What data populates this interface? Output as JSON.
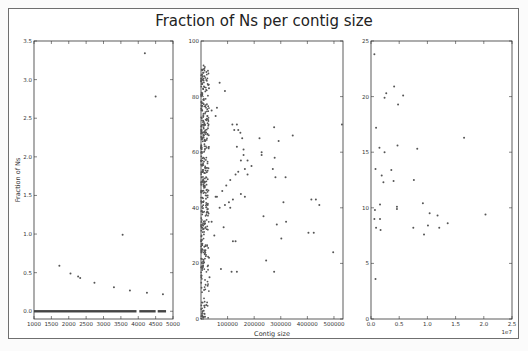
{
  "chart_data": {
    "title": "Fraction of Ns per contig size",
    "type": "scatter",
    "panels": [
      {
        "id": "left",
        "xlabel": "",
        "ylabel": "Fraction of Ns",
        "xlim": [
          1000,
          5000
        ],
        "ylim": [
          -0.1,
          3.5
        ],
        "xticks": [
          1000,
          1500,
          2000,
          2500,
          3000,
          3500,
          4000,
          4500,
          5000
        ],
        "xtick_labels": [
          "1000",
          "1500",
          "2000",
          "2500",
          "3000",
          "3500",
          "4000",
          "4500",
          "5000"
        ],
        "yticks": [
          0.0,
          0.5,
          1.0,
          1.5,
          2.0,
          2.5,
          3.0,
          3.5
        ],
        "ytick_labels": [
          "0.0",
          "0.5",
          "1.0",
          "1.5",
          "2.0",
          "2.5",
          "3.0",
          "3.5"
        ],
        "points": [
          [
            1730,
            0.59
          ],
          [
            2050,
            0.49
          ],
          [
            2270,
            0.45
          ],
          [
            2330,
            0.43
          ],
          [
            2740,
            0.37
          ],
          [
            3300,
            0.31
          ],
          [
            3550,
            0.99
          ],
          [
            3760,
            0.27
          ],
          [
            4190,
            3.34
          ],
          [
            4250,
            0.24
          ],
          [
            4500,
            2.78
          ],
          [
            4710,
            0.22
          ]
        ],
        "baseline_band": {
          "y": 0.0,
          "x_from": 1000,
          "x_to": 4800,
          "gaps": [
            [
              3950,
              4030
            ],
            [
              4500,
              4560
            ]
          ]
        }
      },
      {
        "id": "middle",
        "xlabel": "Contig size",
        "ylabel": "",
        "xlim": [
          0,
          534000
        ],
        "ylim": [
          0,
          100
        ],
        "xticks": [
          100000,
          200000,
          300000,
          400000,
          500000
        ],
        "xtick_labels": [
          "100000",
          "200000",
          "300000",
          "400000",
          "500000"
        ],
        "yticks": [
          0,
          20,
          40,
          60,
          80,
          100
        ],
        "ytick_labels": [
          "0",
          "20",
          "40",
          "60",
          "80",
          "100"
        ],
        "points": [
          [
            530000,
            70
          ],
          [
            345000,
            66
          ],
          [
            275000,
            69
          ],
          [
            292000,
            64
          ],
          [
            220000,
            65
          ],
          [
            228000,
            60
          ],
          [
            228000,
            59
          ],
          [
            277000,
            58
          ],
          [
            270000,
            54
          ],
          [
            280000,
            51
          ],
          [
            318000,
            51
          ],
          [
            415000,
            43
          ],
          [
            432000,
            43
          ],
          [
            445000,
            41
          ],
          [
            310000,
            42
          ],
          [
            235000,
            37
          ],
          [
            285000,
            34
          ],
          [
            320000,
            35
          ],
          [
            404000,
            31
          ],
          [
            424000,
            31
          ],
          [
            497000,
            24
          ],
          [
            302000,
            29
          ],
          [
            245000,
            21
          ],
          [
            275000,
            17
          ],
          [
            118000,
            70
          ],
          [
            125000,
            68
          ],
          [
            135000,
            70
          ],
          [
            140000,
            68
          ],
          [
            148000,
            67
          ],
          [
            155000,
            65
          ],
          [
            135000,
            62
          ],
          [
            160000,
            61
          ],
          [
            160000,
            59
          ],
          [
            150000,
            57
          ],
          [
            175000,
            57
          ],
          [
            190000,
            55
          ],
          [
            165000,
            54
          ],
          [
            140000,
            53
          ],
          [
            130000,
            52
          ],
          [
            175000,
            52
          ],
          [
            110000,
            50
          ],
          [
            95000,
            48
          ],
          [
            80000,
            46
          ],
          [
            60000,
            44
          ],
          [
            55000,
            44
          ],
          [
            150000,
            45
          ],
          [
            165000,
            44
          ],
          [
            120000,
            43
          ],
          [
            105000,
            42
          ],
          [
            90000,
            41
          ],
          [
            70000,
            40
          ],
          [
            110000,
            40
          ],
          [
            85000,
            33
          ],
          [
            120000,
            28
          ],
          [
            130000,
            28
          ],
          [
            75000,
            18
          ],
          [
            115000,
            17
          ],
          [
            135000,
            17
          ],
          [
            90000,
            82
          ],
          [
            70000,
            85
          ],
          [
            60000,
            76
          ],
          [
            55000,
            73
          ],
          [
            40000,
            75
          ],
          [
            30000,
            83
          ],
          [
            20000,
            86
          ],
          [
            40000,
            35
          ],
          [
            50000,
            30
          ],
          [
            30000,
            22
          ],
          [
            25000,
            12
          ],
          [
            20000,
            5
          ],
          [
            10000,
            3
          ],
          [
            5000,
            1
          ],
          [
            8000,
            0.5
          ],
          [
            15000,
            0.8
          ],
          [
            32000,
            15
          ]
        ],
        "dense_cluster": {
          "x_range": [
            500,
            30000
          ],
          "y_range": [
            0,
            92
          ],
          "count": 420
        }
      },
      {
        "id": "right",
        "xlabel": "",
        "ylabel": "",
        "x_offset_label": "1e7",
        "xlim": [
          0,
          2.5
        ],
        "ylim": [
          0,
          25
        ],
        "xticks": [
          0.0,
          0.5,
          1.0,
          1.5,
          2.0,
          2.5
        ],
        "xtick_labels": [
          "0.0",
          "0.5",
          "1.0",
          "1.5",
          "2.0",
          "2.5"
        ],
        "yticks": [
          0,
          5,
          10,
          15,
          20,
          25
        ],
        "ytick_labels": [
          "0",
          "5",
          "10",
          "15",
          "20",
          "25"
        ],
        "points": [
          [
            0.06,
            23.8
          ],
          [
            0.41,
            20.9
          ],
          [
            0.27,
            20.3
          ],
          [
            0.24,
            19.9
          ],
          [
            0.57,
            20.1
          ],
          [
            0.48,
            19.3
          ],
          [
            0.09,
            17.2
          ],
          [
            1.65,
            16.3
          ],
          [
            0.47,
            15.6
          ],
          [
            0.15,
            15.4
          ],
          [
            0.82,
            15.3
          ],
          [
            0.24,
            15.0
          ],
          [
            0.08,
            13.5
          ],
          [
            0.36,
            13.4
          ],
          [
            0.19,
            12.9
          ],
          [
            0.22,
            12.3
          ],
          [
            0.4,
            12.4
          ],
          [
            0.76,
            12.5
          ],
          [
            0.16,
            10.3
          ],
          [
            0.46,
            10.1
          ],
          [
            0.46,
            9.9
          ],
          [
            0.92,
            10.4
          ],
          [
            0.07,
            9.8
          ],
          [
            1.04,
            9.5
          ],
          [
            1.18,
            9.3
          ],
          [
            2.03,
            9.4
          ],
          [
            0.06,
            9.0
          ],
          [
            0.16,
            9.0
          ],
          [
            1.36,
            8.6
          ],
          [
            1.01,
            8.4
          ],
          [
            0.09,
            8.2
          ],
          [
            0.17,
            8.0
          ],
          [
            0.75,
            8.2
          ],
          [
            1.21,
            8.2
          ],
          [
            0.94,
            7.6
          ],
          [
            0.08,
            3.6
          ]
        ]
      }
    ]
  }
}
